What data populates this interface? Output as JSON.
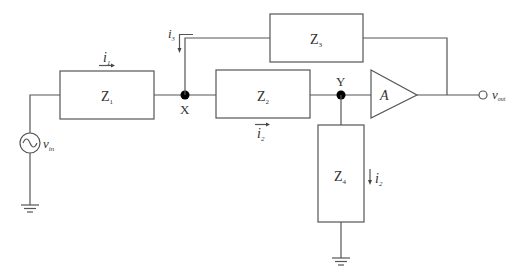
{
  "diagram": {
    "type": "circuit-schematic",
    "components": {
      "z1": {
        "label": "Z",
        "sub": "1"
      },
      "z2": {
        "label": "Z",
        "sub": "2"
      },
      "z3": {
        "label": "Z",
        "sub": "3"
      },
      "z4": {
        "label": "Z",
        "sub": "4"
      },
      "amplifier": {
        "label": "A"
      },
      "source": {
        "label": "v",
        "sub": "in"
      }
    },
    "nodes": {
      "x": {
        "label": "X"
      },
      "y": {
        "label": "Y"
      }
    },
    "currents": {
      "i1": {
        "label": "i",
        "sub": "1"
      },
      "i2_top": {
        "label": "i",
        "sub": "2"
      },
      "i2_z4": {
        "label": "i",
        "sub": "2"
      },
      "i3": {
        "label": "i",
        "sub": "3"
      }
    },
    "output": {
      "label": "v",
      "sub": "out"
    },
    "colors": {
      "line": "#555555",
      "node": "#000000",
      "text": "#333333",
      "background": "#ffffff"
    }
  }
}
